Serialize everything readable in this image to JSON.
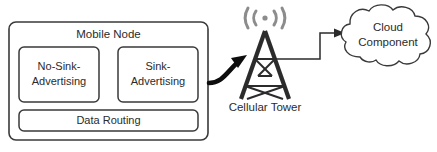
{
  "diagram": {
    "background_color": "#ffffff",
    "stroke_color": "#2b2b2b",
    "wave_color": "#8c8c8c",
    "mobile_node": {
      "label": "Mobile Node",
      "modules": [
        {
          "id": "no-sink-advertising",
          "line1": "No-Sink-",
          "line2": "Advertising"
        },
        {
          "id": "sink-advertising",
          "line1": "Sink-",
          "line2": "Advertising"
        }
      ],
      "data_routing": {
        "label": "Data Routing"
      }
    },
    "cellular_tower": {
      "label": "Cellular Tower",
      "signal_icon": "radio-waves-icon"
    },
    "cloud": {
      "line1": "Cloud",
      "line2": "Component"
    },
    "connections": [
      {
        "id": "mobile-to-tower",
        "style": "thick-curved-arrow",
        "from": "Mobile Node",
        "to": "Cellular Tower"
      },
      {
        "id": "tower-to-cloud",
        "style": "thin-elbow-arrow",
        "from": "Cellular Tower",
        "to": "Cloud Component"
      }
    ]
  }
}
